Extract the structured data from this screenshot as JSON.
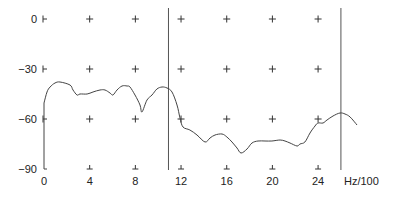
{
  "chart_data": {
    "type": "line",
    "title": "",
    "xlabel": "Hz/100",
    "ylabel": "",
    "xlim": [
      0,
      28
    ],
    "ylim": [
      -90,
      0
    ],
    "x_ticks": [
      0,
      4,
      8,
      12,
      16,
      20,
      24
    ],
    "x_tick_labels": [
      "0",
      "4",
      "8",
      "12",
      "16",
      "20",
      "24"
    ],
    "y_ticks": [
      0,
      -30,
      -60,
      -90
    ],
    "y_tick_labels": [
      "0",
      "−30",
      "−60",
      "−90"
    ],
    "grid": "plus-markers",
    "legend": null,
    "cursors_x": [
      10.9,
      26.0
    ],
    "series": [
      {
        "name": "spectrum",
        "x": [
          0,
          0,
          0.26,
          0.53,
          0.96,
          1.4,
          2.28,
          2.54,
          2.89,
          3.15,
          3.77,
          4.29,
          4.9,
          5.34,
          5.78,
          6.04,
          6.39,
          6.83,
          7.27,
          7.53,
          7.97,
          8.41,
          8.58,
          9.02,
          9.46,
          9.89,
          10.33,
          10.77,
          11.21,
          11.65,
          11.91,
          12.17,
          12.78,
          13.4,
          14.1,
          14.54,
          14.97,
          15.59,
          16.02,
          16.46,
          16.9,
          17.25,
          17.78,
          18.21,
          18.74,
          19.35,
          19.96,
          20.67,
          21.1,
          21.54,
          22.15,
          22.42,
          22.85,
          23.29,
          23.73,
          23.99,
          24.43,
          24.78,
          25.31,
          25.92,
          26.36,
          26.8,
          27.41
        ],
        "y": [
          -90,
          -50.4,
          -43.8,
          -40.8,
          -38.4,
          -37.8,
          -39.6,
          -42.6,
          -45.6,
          -45.0,
          -45.0,
          -43.8,
          -42.6,
          -42.6,
          -44.4,
          -45.6,
          -42.6,
          -40.2,
          -40.2,
          -40.8,
          -45.6,
          -51.6,
          -55.8,
          -48.6,
          -45.6,
          -42.0,
          -40.8,
          -41.4,
          -43.8,
          -51.6,
          -59.4,
          -64.8,
          -66.6,
          -69.6,
          -73.8,
          -71.4,
          -69.6,
          -69.0,
          -70.8,
          -73.8,
          -77.4,
          -80.4,
          -78.0,
          -74.4,
          -73.2,
          -73.2,
          -73.2,
          -72.6,
          -73.2,
          -74.4,
          -76.2,
          -75.0,
          -73.8,
          -68.4,
          -64.2,
          -62.4,
          -62.4,
          -60.6,
          -58.2,
          -56.4,
          -57.0,
          -58.8,
          -63.6
        ]
      }
    ]
  },
  "axes": {
    "x_unit_label": "Hz/100"
  }
}
